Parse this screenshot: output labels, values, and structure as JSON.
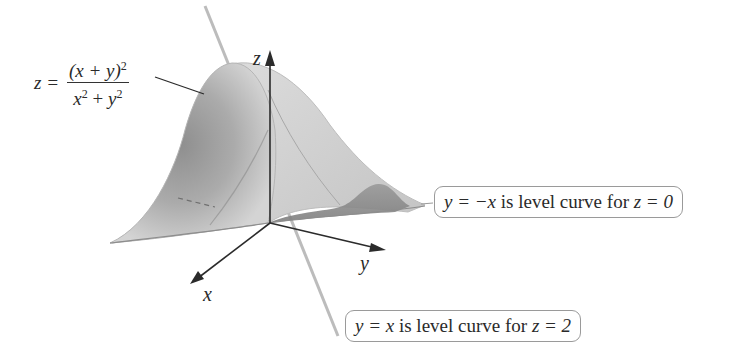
{
  "figure": {
    "formula": {
      "lhs": "z =",
      "numerator": "(x + y)",
      "numerator_exp": "2",
      "denominator_x": "x",
      "denominator_plus": " + ",
      "denominator_y": "y",
      "denominator_exp": "2"
    },
    "axes": {
      "x_label": "x",
      "y_label": "y",
      "z_label": "z"
    },
    "annotations": [
      {
        "id": "level-curve-z0",
        "parts": [
          "y = −x",
          " is level curve for ",
          "z = 0"
        ]
      },
      {
        "id": "level-curve-z2",
        "parts": [
          "y = x",
          " is level curve for ",
          "z = 2"
        ]
      }
    ],
    "colors": {
      "axis": "#2b2b2b",
      "level_line": "#b8b8b8",
      "surface_light": "#d6d6d6",
      "surface_mid": "#b3b3b3",
      "surface_dark": "#8a8a8a",
      "box_border": "#9a9a9a"
    }
  }
}
